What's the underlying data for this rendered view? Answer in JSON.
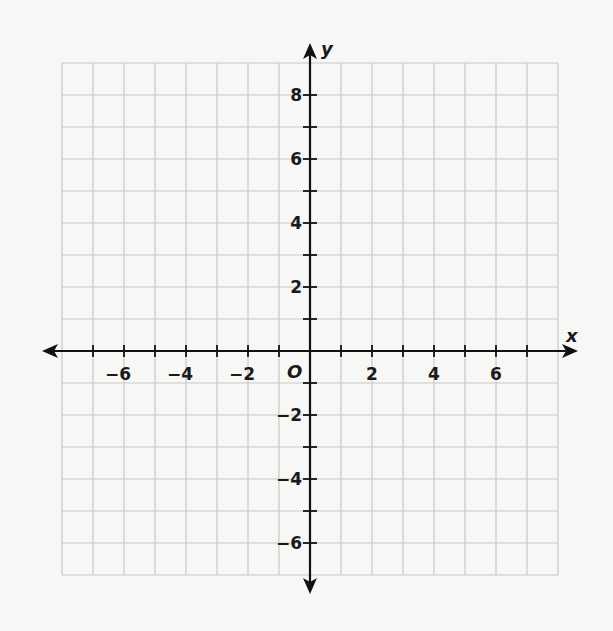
{
  "chart_data": {
    "type": "scatter",
    "title": "",
    "xlabel": "x",
    "ylabel": "y",
    "origin_label": "O",
    "xlim": [
      -8,
      8
    ],
    "ylim": [
      -7,
      9
    ],
    "grid": true,
    "grid_step": 1,
    "x_tick_marks": [
      -7,
      -6,
      -5,
      -4,
      -3,
      -2,
      -1,
      1,
      2,
      3,
      4,
      5,
      6,
      7
    ],
    "y_tick_marks": [
      -6,
      -5,
      -4,
      -3,
      -2,
      -1,
      1,
      2,
      3,
      4,
      5,
      6,
      7,
      8
    ],
    "x_tick_labels": [
      "−6",
      "−4",
      "−2",
      "2",
      "4",
      "6"
    ],
    "x_tick_label_values": [
      -6,
      -4,
      -2,
      2,
      4,
      6
    ],
    "y_tick_labels": [
      "8",
      "6",
      "4",
      "2",
      "−2",
      "−4",
      "−6"
    ],
    "y_tick_label_values": [
      8,
      6,
      4,
      2,
      -2,
      -4,
      -6
    ],
    "series": []
  },
  "style": {
    "grid_color": "#c8c8c8",
    "axis_color": "#111111",
    "background": "#f7f7f5"
  },
  "layout": {
    "origin_px": [
      310,
      351
    ],
    "unit_x_px": 31,
    "unit_y_px": 32,
    "x_arrow_ends_px": [
      42,
      578
    ],
    "y_arrow_ends_px": [
      43,
      594
    ]
  }
}
